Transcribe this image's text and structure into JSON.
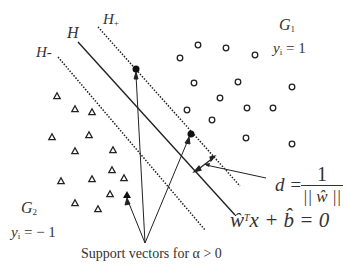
{
  "diagram": {
    "labels": {
      "h_plus": "H",
      "h_plus_sub": "+",
      "h": "H",
      "h_minus": "H-",
      "g1": "G",
      "g1_sub": "1",
      "g1_y": "y",
      "g1_y_sub": "i",
      "g1_y_val": " = 1",
      "g2": "G",
      "g2_sub": "2",
      "g2_y": "y",
      "g2_y_sub": "i",
      "g2_y_val": " = − 1",
      "margin_d": "d = ",
      "margin_num": "1",
      "margin_den": "|| ŵ ||",
      "hyperplane_eq_w": "ŵ",
      "hyperplane_eq_T": "T",
      "hyperplane_eq_rest": "x + b̂ = 0",
      "support_vectors": "Support vectors for α  >  0"
    },
    "colors": {
      "line": "#222222",
      "text": "#333333",
      "marker": "#222222"
    },
    "class_g1_circles": [
      [
        198,
        45
      ],
      [
        226,
        48
      ],
      [
        180,
        58
      ],
      [
        255,
        55
      ],
      [
        194,
        83
      ],
      [
        238,
        82
      ],
      [
        292,
        87
      ],
      [
        220,
        98
      ],
      [
        187,
        110
      ],
      [
        247,
        108
      ],
      [
        273,
        108
      ],
      [
        212,
        120
      ],
      [
        246,
        138
      ],
      [
        292,
        144
      ]
    ],
    "class_g2_triangles": [
      [
        57,
        96
      ],
      [
        75,
        109
      ],
      [
        92,
        112
      ],
      [
        52,
        137
      ],
      [
        89,
        135
      ],
      [
        75,
        151
      ],
      [
        113,
        150
      ],
      [
        112,
        170
      ],
      [
        61,
        181
      ],
      [
        92,
        179
      ],
      [
        124,
        178
      ],
      [
        110,
        194
      ],
      [
        75,
        203
      ],
      [
        98,
        209
      ]
    ],
    "support_vectors_circles": [
      [
        136,
        69
      ],
      [
        191,
        134
      ]
    ],
    "support_vectors_triangles": [
      [
        127,
        195
      ]
    ]
  }
}
